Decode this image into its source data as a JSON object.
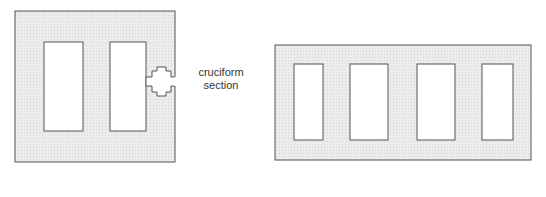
{
  "diagram": {
    "left_figure": {
      "name": "two-opening wall panel",
      "annotation": [
        "cruciform",
        "section"
      ]
    },
    "right_figure": {
      "name": "four-opening wall panel"
    },
    "colors": {
      "panel_fill": "#e8e8e8",
      "stroke": "#555555",
      "opening_fill": "#ffffff"
    }
  }
}
